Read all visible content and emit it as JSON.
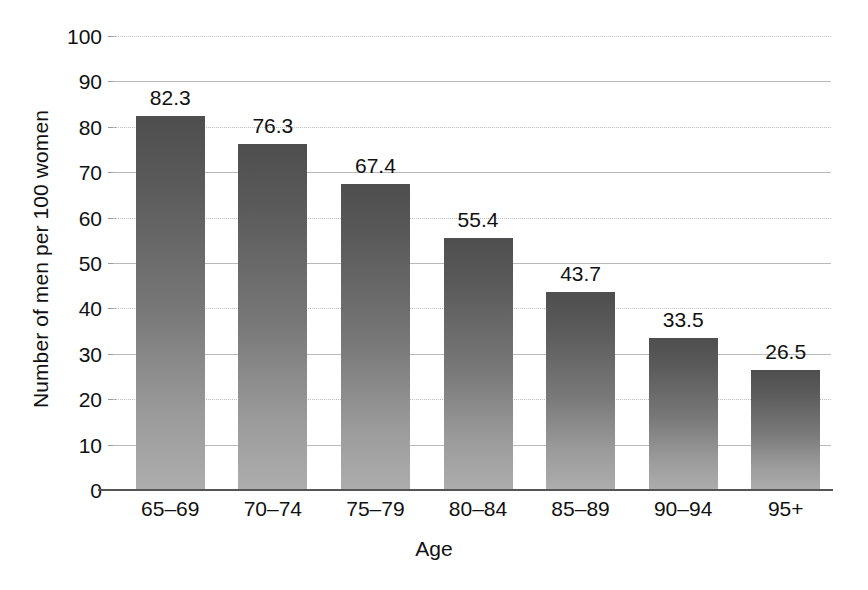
{
  "chart_data": {
    "type": "bar",
    "title": "",
    "xlabel": "Age",
    "ylabel": "Number of men per 100 women",
    "categories": [
      "65–69",
      "70–74",
      "75–79",
      "80–84",
      "85–89",
      "90–94",
      "95+"
    ],
    "values": [
      82.3,
      76.3,
      67.4,
      55.4,
      43.7,
      33.5,
      26.5
    ],
    "value_labels": [
      "82.3",
      "76.3",
      "67.4",
      "55.4",
      "43.7",
      "33.5",
      "26.5"
    ],
    "ylim": [
      0,
      100
    ],
    "ytick_labels": [
      "0",
      "10",
      "20",
      "30",
      "40",
      "50",
      "60",
      "70",
      "80",
      "90",
      "100"
    ],
    "ytick_values": [
      0,
      10,
      20,
      30,
      40,
      50,
      60,
      70,
      80,
      90,
      100
    ],
    "grid": true,
    "grid_axis": "y",
    "legend": "none",
    "bar_color_top": "#4e4e4e",
    "bar_color_bottom": "#adadad",
    "axis_color": "#555555",
    "gridline_color": "#b9b9b9",
    "text_color": "#111111",
    "background": "#ffffff"
  }
}
